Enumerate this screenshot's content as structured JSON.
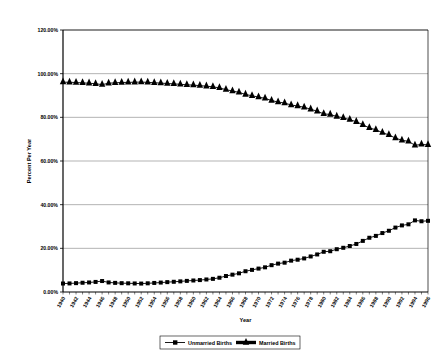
{
  "chart_data": {
    "type": "line",
    "title": "",
    "xlabel": "Year",
    "ylabel": "Percent Per Year",
    "ylim": [
      0,
      1.2
    ],
    "ytick_labels": [
      "0.00%",
      "20.00%",
      "40.00%",
      "60.00%",
      "80.00%",
      "100.00%",
      "120.00%"
    ],
    "ytick_values": [
      0,
      0.2,
      0.4,
      0.6,
      0.8,
      1.0,
      1.2
    ],
    "grid": true,
    "legend_position": "bottom",
    "x": [
      1940,
      1941,
      1942,
      1943,
      1944,
      1945,
      1946,
      1947,
      1948,
      1949,
      1950,
      1951,
      1952,
      1953,
      1954,
      1955,
      1956,
      1957,
      1958,
      1959,
      1960,
      1961,
      1962,
      1963,
      1964,
      1965,
      1966,
      1967,
      1968,
      1969,
      1970,
      1971,
      1972,
      1973,
      1974,
      1975,
      1976,
      1977,
      1978,
      1979,
      1980,
      1981,
      1982,
      1983,
      1984,
      1985,
      1986,
      1987,
      1988,
      1989,
      1990,
      1991,
      1992,
      1993,
      1994,
      1995,
      1996
    ],
    "xtick_labels": [
      "1940",
      "1942",
      "1944",
      "1946",
      "1948",
      "1950",
      "1952",
      "1954",
      "1956",
      "1958",
      "1960",
      "1962",
      "1964",
      "1966",
      "1968",
      "1970",
      "1972",
      "1974",
      "1976",
      "1978",
      "1980",
      "1982",
      "1984",
      "1986",
      "1988",
      "1990",
      "1992",
      "1994",
      "1996"
    ],
    "series": [
      {
        "name": "Unmarried Births",
        "marker": "square",
        "color": "#000000",
        "values": [
          0.0389,
          0.0393,
          0.0406,
          0.0423,
          0.0437,
          0.0461,
          0.0502,
          0.0438,
          0.0418,
          0.0405,
          0.0398,
          0.0391,
          0.0386,
          0.0398,
          0.0415,
          0.0432,
          0.0452,
          0.0468,
          0.0487,
          0.0509,
          0.0527,
          0.0546,
          0.0574,
          0.0602,
          0.0653,
          0.0732,
          0.0794,
          0.0855,
          0.0951,
          0.1013,
          0.1072,
          0.113,
          0.1229,
          0.13,
          0.1343,
          0.1436,
          0.1479,
          0.1538,
          0.1628,
          0.172,
          0.1842,
          0.1868,
          0.196,
          0.2025,
          0.2107,
          0.22,
          0.2341,
          0.2484,
          0.257,
          0.27,
          0.2805,
          0.295,
          0.305,
          0.31,
          0.328,
          0.324,
          0.326
        ]
      },
      {
        "name": "Married Births",
        "marker": "triangle",
        "color": "#000000",
        "values": [
          0.9611,
          0.9607,
          0.9594,
          0.9577,
          0.9563,
          0.9539,
          0.9498,
          0.9562,
          0.9582,
          0.9595,
          0.9602,
          0.9609,
          0.9614,
          0.9602,
          0.9585,
          0.9568,
          0.9548,
          0.9532,
          0.9513,
          0.9491,
          0.9473,
          0.9454,
          0.9426,
          0.9398,
          0.9347,
          0.9268,
          0.9206,
          0.9145,
          0.9049,
          0.8987,
          0.8928,
          0.887,
          0.8771,
          0.87,
          0.8657,
          0.8564,
          0.8521,
          0.8462,
          0.8372,
          0.828,
          0.8158,
          0.8132,
          0.804,
          0.7975,
          0.7893,
          0.78,
          0.7659,
          0.7516,
          0.743,
          0.73,
          0.7195,
          0.705,
          0.695,
          0.69,
          0.672,
          0.676,
          0.674
        ]
      }
    ]
  },
  "legend": {
    "items": [
      {
        "label": "Unmarried Births"
      },
      {
        "label": "Married Births"
      }
    ]
  }
}
